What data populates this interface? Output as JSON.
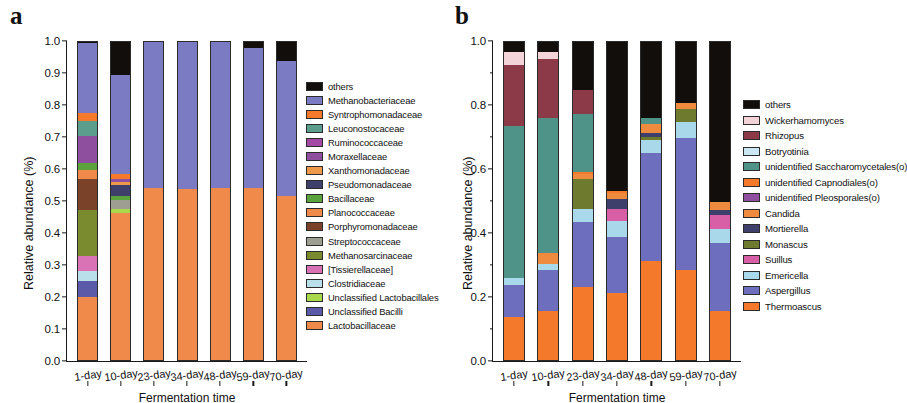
{
  "figure": {
    "panels": [
      {
        "id": "a",
        "label": "a",
        "axis": {
          "ylabel": "Relative abundance (%)",
          "xlabel": "Fermentation time",
          "yticks": [
            "0.0",
            "0.1",
            "0.2",
            "0.3",
            "0.4",
            "0.5",
            "0.6",
            "0.7",
            "0.8",
            "0.9",
            "1.0"
          ],
          "ytick_values": [
            0.0,
            0.1,
            0.2,
            0.3,
            0.4,
            0.5,
            0.6,
            0.7,
            0.8,
            0.9,
            1.0
          ],
          "ylim": [
            0,
            1
          ]
        },
        "chart_data": {
          "type": "bar",
          "stacked": true,
          "title": "",
          "xlabel": "Fermentation time",
          "ylabel": "Relative abundance (%)",
          "ylim": [
            0,
            1
          ],
          "grid": false,
          "legend_position": "right",
          "categories": [
            "1-day",
            "10-day",
            "23-day",
            "34-day",
            "48-day",
            "59-day",
            "70-day"
          ],
          "series": [
            {
              "name": "Lactobacillaceae",
              "color": "#F08A4B",
              "values": [
                0.197,
                0.46,
                0.538,
                0.534,
                0.538,
                0.536,
                0.513
              ]
            },
            {
              "name": "Unclassified Bacilli",
              "color": "#5A5AA8",
              "values": [
                0.05,
                0.0,
                0.0,
                0.0,
                0.0,
                0.0,
                0.0
              ]
            },
            {
              "name": "Unclassified Lactobacillales",
              "color": "#A8D84B",
              "values": [
                0.0,
                0.012,
                0.0,
                0.0,
                0.0,
                0.0,
                0.0
              ]
            },
            {
              "name": "Clostridiaceae",
              "color": "#B9E0EA",
              "values": [
                0.032,
                0.0,
                0.0,
                0.0,
                0.0,
                0.0,
                0.0
              ]
            },
            {
              "name": "[Tissierellaceae]",
              "color": "#D973B5",
              "values": [
                0.047,
                0.0,
                0.0,
                0.0,
                0.0,
                0.0,
                0.0
              ]
            },
            {
              "name": "Methanosarcinaceae",
              "color": "#7A8A2E",
              "values": [
                0.143,
                0.0,
                0.0,
                0.0,
                0.0,
                0.0,
                0.0
              ]
            },
            {
              "name": "Streptococcaceae",
              "color": "#9E9E93",
              "values": [
                0.0,
                0.028,
                0.0,
                0.0,
                0.0,
                0.0,
                0.0
              ]
            },
            {
              "name": "Porphyromonadaceae",
              "color": "#7A4228",
              "values": [
                0.098,
                0.0,
                0.0,
                0.0,
                0.0,
                0.0,
                0.0
              ]
            },
            {
              "name": "Planococcaceae",
              "color": "#F08A4B",
              "values": [
                0.028,
                0.0,
                0.0,
                0.0,
                0.0,
                0.0,
                0.0
              ]
            },
            {
              "name": "Bacillaceae",
              "color": "#5BA23C",
              "values": [
                0.02,
                0.014,
                0.0,
                0.0,
                0.0,
                0.0,
                0.0
              ]
            },
            {
              "name": "Pseudomonadaceae",
              "color": "#3F3F6B",
              "values": [
                0.0,
                0.033,
                0.0,
                0.0,
                0.0,
                0.0,
                0.0
              ]
            },
            {
              "name": "Xanthomonadaceae",
              "color": "#EE9A4A",
              "values": [
                0.0,
                0.01,
                0.0,
                0.0,
                0.0,
                0.0,
                0.0
              ]
            },
            {
              "name": "Moraxellaceae",
              "color": "#8E4F9E",
              "values": [
                0.085,
                0.008,
                0.0,
                0.0,
                0.0,
                0.0,
                0.0
              ]
            },
            {
              "name": "Ruminococcaceae",
              "color": "#A349A4",
              "values": [
                0.0,
                0.0,
                0.0,
                0.0,
                0.0,
                0.0,
                0.0
              ]
            },
            {
              "name": "Leuconostocaceae",
              "color": "#5C9E8E",
              "values": [
                0.046,
                0.0,
                0.0,
                0.0,
                0.0,
                0.0,
                0.0
              ]
            },
            {
              "name": "Syntrophomonadaceae",
              "color": "#F4792A",
              "values": [
                0.026,
                0.016,
                0.0,
                0.0,
                0.0,
                0.0,
                0.0
              ]
            },
            {
              "name": "Methanobacteriaceae",
              "color": "#7B7BC4",
              "values": [
                0.22,
                0.309,
                0.457,
                0.461,
                0.457,
                0.439,
                0.422
              ]
            },
            {
              "name": "others",
              "color": "#110E0C",
              "values": [
                0.008,
                0.11,
                0.005,
                0.005,
                0.005,
                0.025,
                0.065
              ]
            }
          ]
        },
        "legend": [
          {
            "label": "others",
            "color": "#110E0C"
          },
          {
            "label": "Methanobacteriaceae",
            "color": "#7B7BC4"
          },
          {
            "label": "Syntrophomonadaceae",
            "color": "#F4792A"
          },
          {
            "label": "Leuconostocaceae",
            "color": "#5C9E8E"
          },
          {
            "label": "Ruminococcaceae",
            "color": "#A349A4"
          },
          {
            "label": "Moraxellaceae",
            "color": "#8E4F9E"
          },
          {
            "label": "Xanthomonadaceae",
            "color": "#EE9A4A"
          },
          {
            "label": "Pseudomonadaceae",
            "color": "#3F3F6B"
          },
          {
            "label": "Bacillaceae",
            "color": "#5BA23C"
          },
          {
            "label": "Planococcaceae",
            "color": "#F08A4B"
          },
          {
            "label": "Porphyromonadaceae",
            "color": "#7A4228"
          },
          {
            "label": "Streptococcaceae",
            "color": "#9E9E93"
          },
          {
            "label": "Methanosarcinaceae",
            "color": "#7A8A2E"
          },
          {
            "label": "[Tissierellaceae]",
            "color": "#D973B5"
          },
          {
            "label": "Clostridiaceae",
            "color": "#B9E0EA"
          },
          {
            "label": "Unclassified Lactobacillales",
            "color": "#A8D84B"
          },
          {
            "label": "Unclassified Bacilli",
            "color": "#5A5AA8"
          },
          {
            "label": "Lactobacillaceae",
            "color": "#F08A4B"
          }
        ]
      },
      {
        "id": "b",
        "label": "b",
        "axis": {
          "ylabel": "Relative abundance (%)",
          "xlabel": "Fermentation time",
          "yticks": [
            "0.0",
            "0.2",
            "0.4",
            "0.6",
            "0.8",
            "1.0"
          ],
          "ytick_values": [
            0.0,
            0.2,
            0.4,
            0.6,
            0.8,
            1.0
          ],
          "ylim": [
            0,
            1
          ]
        },
        "chart_data": {
          "type": "bar",
          "stacked": true,
          "title": "",
          "xlabel": "Fermentation time",
          "ylabel": "Relative abundance (%)",
          "ylim": [
            0,
            1
          ],
          "grid": false,
          "legend_position": "right",
          "categories": [
            "1-day",
            "10-day",
            "23-day",
            "34-day",
            "48-day",
            "59-day",
            "70-day"
          ],
          "series": [
            {
              "name": "Thermoascus",
              "color": "#F4792A",
              "values": [
                0.133,
                0.152,
                0.227,
                0.21,
                0.31,
                0.282,
                0.152
              ]
            },
            {
              "name": "Aspergillus",
              "color": "#6E6EBE",
              "values": [
                0.102,
                0.128,
                0.203,
                0.175,
                0.337,
                0.413,
                0.213
              ]
            },
            {
              "name": "Emericella",
              "color": "#A8D8EA",
              "values": [
                0.021,
                0.019,
                0.043,
                0.048,
                0.04,
                0.05,
                0.045
              ]
            },
            {
              "name": "Suillus",
              "color": "#D85FA6",
              "values": [
                0.0,
                0.0,
                0.0,
                0.04,
                0.0,
                0.0,
                0.042
              ]
            },
            {
              "name": "Monascus",
              "color": "#6E7B2E",
              "values": [
                0.0,
                0.0,
                0.093,
                0.0,
                0.009,
                0.04,
                0.0
              ]
            },
            {
              "name": "Mortierella",
              "color": "#3F3F6B",
              "values": [
                0.0,
                0.0,
                0.0,
                0.03,
                0.013,
                0.0,
                0.018
              ]
            },
            {
              "name": "Candida",
              "color": "#EE8B3E",
              "values": [
                0.0,
                0.035,
                0.016,
                0.019,
                0.028,
                0.017,
                0.024
              ]
            },
            {
              "name": "unidentified Pleosporales(o)",
              "color": "#8E4F9E",
              "values": [
                0.0,
                0.0,
                0.0,
                0.0,
                0.0,
                0.0,
                0.0
              ]
            },
            {
              "name": "unidentified Capnodiales(o)",
              "color": "#F4792A",
              "values": [
                0.0,
                0.0,
                0.006,
                0.007,
                0.0,
                0.0,
                0.0
              ]
            },
            {
              "name": "unidentified Saccharomycetales(o)",
              "color": "#4F9287",
              "values": [
                0.475,
                0.422,
                0.18,
                0.0,
                0.02,
                0.0,
                0.0
              ]
            },
            {
              "name": "Botryotinia",
              "color": "#CBE7F4",
              "values": [
                0.0,
                0.0,
                0.0,
                0.0,
                0.0,
                0.0,
                0.0
              ]
            },
            {
              "name": "Rhizopus",
              "color": "#8C3A48",
              "values": [
                0.19,
                0.184,
                0.076,
                0.0,
                0.0,
                0.0,
                0.0
              ]
            },
            {
              "name": "Wickerhamomyces",
              "color": "#F2D4D8",
              "values": [
                0.04,
                0.022,
                0.0,
                0.0,
                0.0,
                0.0,
                0.0
              ]
            },
            {
              "name": "others",
              "color": "#110E0C",
              "values": [
                0.039,
                0.038,
                0.156,
                0.471,
                0.243,
                0.198,
                0.506
              ]
            }
          ]
        },
        "legend": [
          {
            "label": "others",
            "color": "#110E0C"
          },
          {
            "label": "Wickerhamomyces",
            "color": "#F2D4D8"
          },
          {
            "label": "Rhizopus",
            "color": "#8C3A48"
          },
          {
            "label": "Botryotinia",
            "color": "#CBE7F4"
          },
          {
            "label": "unidentified Saccharomycetales(o)",
            "color": "#4F9287"
          },
          {
            "label": "unidentified Capnodiales(o)",
            "color": "#F4792A"
          },
          {
            "label": "unidentified Pleosporales(o)",
            "color": "#8E4F9E"
          },
          {
            "label": "Candida",
            "color": "#EE8B3E"
          },
          {
            "label": "Mortierella",
            "color": "#3F3F6B"
          },
          {
            "label": "Monascus",
            "color": "#6E7B2E"
          },
          {
            "label": "Suillus",
            "color": "#D85FA6"
          },
          {
            "label": "Emericella",
            "color": "#A8D8EA"
          },
          {
            "label": "Aspergillus",
            "color": "#6E6EBE"
          },
          {
            "label": "Thermoascus",
            "color": "#F4792A"
          }
        ]
      }
    ]
  }
}
